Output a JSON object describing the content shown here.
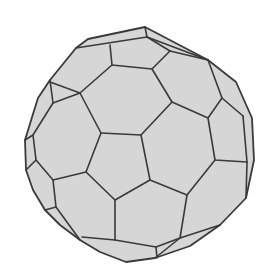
{
  "figure": {
    "title": "",
    "colors": {
      "background": "#ffffff",
      "face_fill": "#d6d6d6",
      "edge": "#3a3a3a"
    }
  }
}
